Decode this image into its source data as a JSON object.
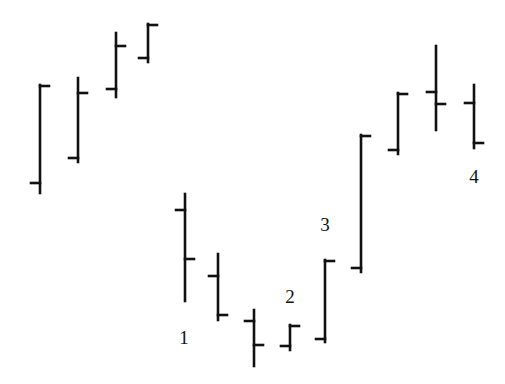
{
  "chart_data": {
    "type": "ohlc",
    "title": "",
    "xlabel": "",
    "ylabel": "",
    "grid": false,
    "legend": null,
    "note": "Values are in pixel-derived price units (price = 384 - y); no axes shown.",
    "bar_color": "#111111",
    "bars": [
      {
        "x": 40,
        "open": 201,
        "high": 299,
        "low": 191,
        "close": 298
      },
      {
        "x": 78,
        "open": 226,
        "high": 306,
        "low": 222,
        "close": 291
      },
      {
        "x": 116,
        "open": 295,
        "high": 351,
        "low": 287,
        "close": 338
      },
      {
        "x": 148,
        "open": 326,
        "high": 360,
        "low": 322,
        "close": 359
      },
      {
        "x": 185,
        "open": 174,
        "high": 190,
        "low": 83,
        "close": 125
      },
      {
        "x": 218,
        "open": 108,
        "high": 130,
        "low": 64,
        "close": 69
      },
      {
        "x": 254,
        "open": 63,
        "high": 74,
        "low": 18,
        "close": 39
      },
      {
        "x": 290,
        "open": 38,
        "high": 59,
        "low": 34,
        "close": 58
      },
      {
        "x": 325,
        "open": 45,
        "high": 124,
        "low": 42,
        "close": 123
      },
      {
        "x": 361,
        "open": 116,
        "high": 249,
        "low": 112,
        "close": 248
      },
      {
        "x": 398,
        "open": 234,
        "high": 291,
        "low": 230,
        "close": 290
      },
      {
        "x": 436,
        "open": 292,
        "high": 338,
        "low": 254,
        "close": 280
      },
      {
        "x": 474,
        "open": 281,
        "high": 299,
        "low": 236,
        "close": 241
      }
    ],
    "annotations": [
      {
        "text": "1",
        "x": 184,
        "y": 337
      },
      {
        "text": "2",
        "x": 290,
        "y": 296
      },
      {
        "text": "3",
        "x": 325,
        "y": 224
      },
      {
        "text": "4",
        "x": 474,
        "y": 176
      }
    ]
  },
  "labels": {
    "a1": "1",
    "a2": "2",
    "a3": "3",
    "a4": "4"
  }
}
